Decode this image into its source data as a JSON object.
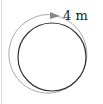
{
  "diagram": {
    "type": "circle-perimeter",
    "label": "4 m",
    "colors": {
      "circle": "#333333",
      "arrow": "#999999",
      "text": "#222222"
    }
  }
}
